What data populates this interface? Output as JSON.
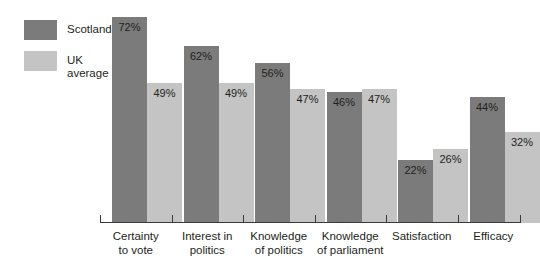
{
  "figure": {
    "clipped_title": "",
    "background_color": "#ffffff"
  },
  "legend": {
    "items": [
      {
        "label": "Scotland",
        "color": "#7b7b7b"
      },
      {
        "label": "UK average",
        "color": "#c4c4c4"
      }
    ]
  },
  "axis": {
    "baseline_color": "#3a3a3a"
  },
  "chart_data": {
    "type": "bar",
    "title": "",
    "xlabel": "",
    "ylabel": "",
    "ylim": [
      0,
      78
    ],
    "grid": false,
    "legend_position": "top-left",
    "value_suffix": "%",
    "categories": [
      "Certainty to vote",
      "Interest in politics",
      "Knowledge of politics",
      "Knowledge of parliament",
      "Satisfaction",
      "Efficacy"
    ],
    "category_lines": [
      [
        "Certainty",
        "to vote"
      ],
      [
        "Interest in",
        "politics"
      ],
      [
        "Knowledge",
        "of politics"
      ],
      [
        "Knowledge",
        "of parliament"
      ],
      [
        "Satisfaction",
        ""
      ],
      [
        "Efficacy",
        ""
      ]
    ],
    "series": [
      {
        "name": "Scotland",
        "color": "#7b7b7b",
        "values": [
          72,
          62,
          56,
          46,
          22,
          44
        ],
        "labels": [
          "72%",
          "62%",
          "56%",
          "46%",
          "22%",
          "44%"
        ]
      },
      {
        "name": "UK average",
        "color": "#c4c4c4",
        "values": [
          49,
          49,
          47,
          47,
          26,
          32
        ],
        "labels": [
          "49%",
          "49%",
          "47%",
          "47%",
          "26%",
          "32%"
        ]
      }
    ]
  }
}
